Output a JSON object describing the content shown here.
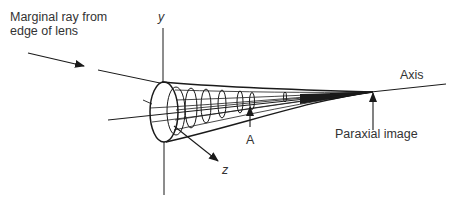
{
  "diagram": {
    "labels": {
      "marginal_ray_line1": "Marginal ray from",
      "marginal_ray_line2": "edge of lens",
      "y_axis": "y",
      "z_axis": "z",
      "axis": "Axis",
      "point_a": "A",
      "paraxial_image": "Paraxial image"
    },
    "colors": {
      "ink": "#1a1a1a",
      "text": "#333333",
      "background": "#ffffff"
    }
  }
}
